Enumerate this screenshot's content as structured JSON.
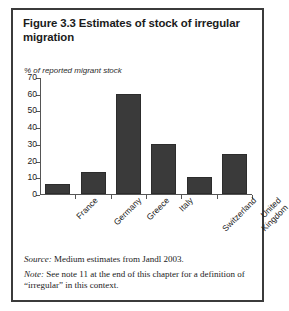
{
  "figure": {
    "title": "Figure 3.3  Estimates of stock of irregular migration",
    "source_key": "Source:",
    "source_text": " Medium estimates from Jandl 2003.",
    "note_key": "Note:",
    "note_text": " See note 11 at the end of this chapter for a definition of “irregular” in this context."
  },
  "chart_data": {
    "type": "bar",
    "title": "Figure 3.3  Estimates of stock of irregular migration",
    "subtitle": "% of reported migrant stock",
    "xlabel": "",
    "ylabel": "% of reported migrant stock",
    "ylim": [
      0,
      70
    ],
    "yticks": [
      0,
      10,
      20,
      30,
      40,
      50,
      60,
      70
    ],
    "grid": false,
    "legend": "none",
    "categories": [
      "France",
      "Germany",
      "Greece",
      "Italy",
      "Switzerland",
      "United Kingdom"
    ],
    "values": [
      6,
      13,
      60,
      30,
      10,
      24
    ],
    "bar_color": "#3a3a3a",
    "series": [
      {
        "name": "% of reported migrant stock",
        "values": [
          6,
          13,
          60,
          30,
          10,
          24
        ]
      }
    ]
  }
}
